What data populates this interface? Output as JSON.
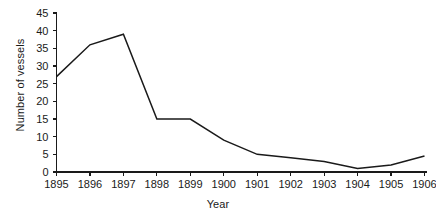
{
  "chart_data": {
    "type": "line",
    "title": "",
    "xlabel": "Year",
    "ylabel": "Number of vessels",
    "categories": [
      "1895",
      "1896",
      "1897",
      "1898",
      "1899",
      "1900",
      "1901",
      "1902",
      "1903",
      "1904",
      "1905",
      "1906"
    ],
    "values": [
      27,
      36,
      39,
      15,
      15,
      9,
      5,
      4,
      3,
      1,
      2,
      4.5
    ],
    "xlim": [
      "1895",
      "1906"
    ],
    "ylim": [
      0,
      45
    ],
    "ytick_values": [
      0,
      5,
      10,
      15,
      20,
      25,
      30,
      35,
      40,
      45
    ],
    "ytick_labels": [
      "0",
      "5",
      "10",
      "15",
      "20",
      "25",
      "30",
      "35",
      "40",
      "45"
    ],
    "xtick_labels": [
      "1895",
      "1896",
      "1897",
      "1898",
      "1899",
      "1900",
      "1901",
      "1902",
      "1903",
      "1904",
      "1905",
      "1906"
    ],
    "grid": false,
    "legend": null,
    "series": [
      {
        "name": "Number of vessels",
        "color": "#1a1a1a",
        "values": [
          27,
          36,
          39,
          15,
          15,
          9,
          5,
          4,
          3,
          1,
          2,
          4.5
        ]
      }
    ]
  },
  "colors": {
    "line": "#1a1a1a",
    "axis": "#1a1a1a",
    "background": "#ffffff"
  }
}
